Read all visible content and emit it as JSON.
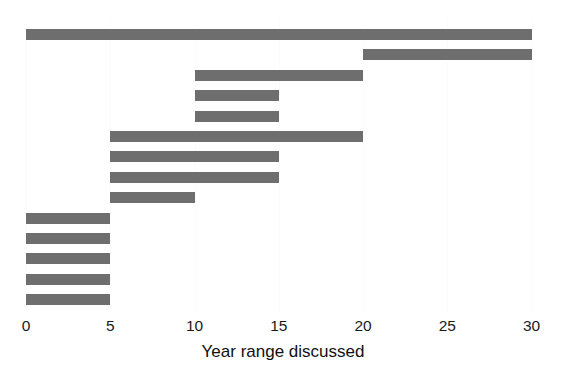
{
  "chart_data": {
    "type": "bar",
    "orientation": "horizontal",
    "subtype": "range-bar",
    "title": "",
    "xlabel": "Year range discussed",
    "ylabel": "",
    "xlim": [
      0,
      30
    ],
    "xticks": [
      0,
      5,
      10,
      15,
      20,
      25,
      30
    ],
    "xticklabels": [
      "0",
      "5",
      "10",
      "15",
      "20",
      "25",
      "30"
    ],
    "grid": true,
    "grid_axis": "x",
    "legend": false,
    "bar_color": "#6e6e6e",
    "background_color": "#ffffff",
    "n_bars": 14,
    "ranges": [
      {
        "index": 1,
        "start": 0,
        "end": 30,
        "span": 30
      },
      {
        "index": 2,
        "start": 20,
        "end": 30,
        "span": 10
      },
      {
        "index": 3,
        "start": 10,
        "end": 20,
        "span": 10
      },
      {
        "index": 4,
        "start": 10,
        "end": 15,
        "span": 5
      },
      {
        "index": 5,
        "start": 10,
        "end": 15,
        "span": 5
      },
      {
        "index": 6,
        "start": 5,
        "end": 20,
        "span": 15
      },
      {
        "index": 7,
        "start": 5,
        "end": 15,
        "span": 10
      },
      {
        "index": 8,
        "start": 5,
        "end": 15,
        "span": 10
      },
      {
        "index": 9,
        "start": 5,
        "end": 10,
        "span": 5
      },
      {
        "index": 10,
        "start": 0,
        "end": 5,
        "span": 5
      },
      {
        "index": 11,
        "start": 0,
        "end": 5,
        "span": 5
      },
      {
        "index": 12,
        "start": 0,
        "end": 5,
        "span": 5
      },
      {
        "index": 13,
        "start": 0,
        "end": 5,
        "span": 5
      },
      {
        "index": 14,
        "start": 0,
        "end": 5,
        "span": 5
      }
    ]
  },
  "axis": {
    "x_label": "Year range discussed",
    "ticks": [
      {
        "value": 0,
        "label": "0"
      },
      {
        "value": 5,
        "label": "5"
      },
      {
        "value": 10,
        "label": "10"
      },
      {
        "value": 15,
        "label": "15"
      },
      {
        "value": 20,
        "label": "20"
      },
      {
        "value": 25,
        "label": "25"
      },
      {
        "value": 30,
        "label": "30"
      }
    ]
  },
  "layout": {
    "pixels": {
      "x_origin_px": 26,
      "px_per_unit": 16.85,
      "first_bar_top_px": 29,
      "bar_pitch_px": 20.4,
      "bar_height_px": 11
    }
  }
}
